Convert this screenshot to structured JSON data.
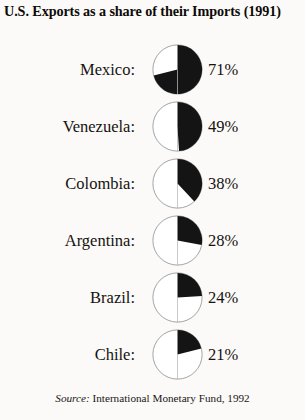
{
  "title": "U.S. Exports as a share of their Imports (1991)",
  "source": {
    "label": "Source:",
    "text": "International Monetary Fund, 1992"
  },
  "style": {
    "fill_color": "#141414",
    "outline_color": "#9a9a9a",
    "background_color": "#fbfaf8"
  },
  "chart_data": {
    "type": "pie",
    "title": "U.S. Exports as a share of their Imports (1991)",
    "xlabel": "",
    "ylabel": "",
    "unit": "%",
    "note": "Each small pie shows the percent of that country's imports from the U.S. covered by U.S. exports; filled wedge sweeps clockwise from 12 o'clock.",
    "categories": [
      "Mexico",
      "Venezuela",
      "Colombia",
      "Argentina",
      "Brazil",
      "Chile"
    ],
    "values": [
      71,
      49,
      38,
      28,
      24,
      21
    ],
    "series": [
      {
        "name": "U.S. Exports as a share of Imports",
        "values": [
          71,
          49,
          38,
          28,
          24,
          21
        ]
      }
    ],
    "items": [
      {
        "label": "Mexico:",
        "value": 71,
        "value_text": "71%"
      },
      {
        "label": "Venezuela:",
        "value": 49,
        "value_text": "49%"
      },
      {
        "label": "Colombia:",
        "value": 38,
        "value_text": "38%"
      },
      {
        "label": "Argentina:",
        "value": 28,
        "value_text": "28%"
      },
      {
        "label": "Brazil:",
        "value": 24,
        "value_text": "24%"
      },
      {
        "label": "Chile:",
        "value": 21,
        "value_text": "21%"
      }
    ]
  }
}
